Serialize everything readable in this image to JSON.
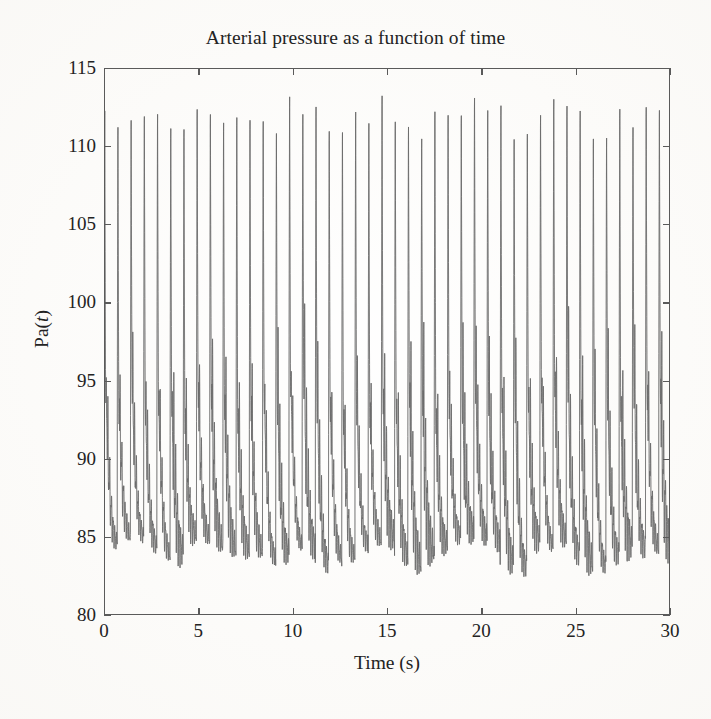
{
  "figure": {
    "background_color": "#fcfbf9",
    "line_color": "#6a6a6a",
    "axis_color": "#5a5a5a"
  },
  "chart_data": {
    "type": "line",
    "title": "Arterial pressure as a function of time",
    "xlabel": "Time (s)",
    "ylabel": "Pa(t)",
    "ylabel_parts": {
      "prefix": "Pa(",
      "italic": "t",
      "suffix": ")"
    },
    "xlim": [
      0,
      30
    ],
    "ylim": [
      80,
      115
    ],
    "xticks": [
      0,
      5,
      10,
      15,
      20,
      25,
      30
    ],
    "yticks": [
      80,
      85,
      90,
      95,
      100,
      105,
      110,
      115
    ],
    "xtick_labels": [
      "0",
      "5",
      "10",
      "15",
      "20",
      "25",
      "30"
    ],
    "ytick_labels": [
      "80",
      "85",
      "90",
      "95",
      "100",
      "105",
      "110",
      "115"
    ],
    "grid": false,
    "legend": null,
    "series": [
      {
        "name": "Pa(t)",
        "description": "Arterial blood pressure waveform with rapid systolic upstroke, sharp diastolic decline and dense dicrotic oscillations",
        "units": "mmHg",
        "systolic_peak": 114,
        "diastolic_trough": 83,
        "mean_pressure": 92,
        "oscillation_band": [
          86,
          94
        ],
        "beat_period_s": 0.7,
        "heart_rate_bpm": 86,
        "n_beats": 43,
        "sample_rate_hz": 200,
        "duration_s": 30
      }
    ],
    "axis_ticks_direction": "in",
    "frame": "full-box"
  }
}
